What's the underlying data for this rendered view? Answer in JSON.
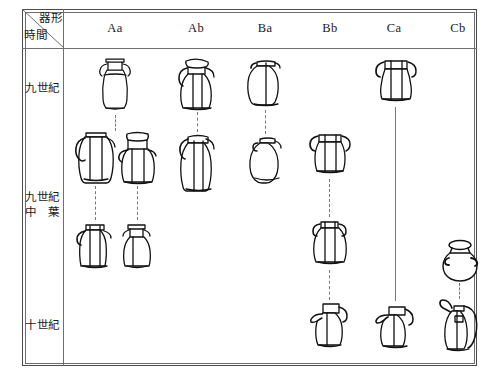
{
  "figure": {
    "kind": "ceramic-typology-chart",
    "corner": {
      "column_axis_label": "器形",
      "row_axis_label": "時間"
    },
    "columns": [
      {
        "key": "Aa",
        "label": "Aa",
        "x": 115
      },
      {
        "key": "Ab",
        "label": "Ab",
        "x": 196
      },
      {
        "key": "Ba",
        "label": "Ba",
        "x": 265
      },
      {
        "key": "Bb",
        "label": "Bb",
        "x": 330
      },
      {
        "key": "Ca",
        "label": "Ca",
        "x": 394
      },
      {
        "key": "Cb",
        "label": "Cb",
        "x": 458
      }
    ],
    "rows": [
      {
        "key": "r1",
        "label": "九世紀",
        "label_lines": [
          "九世紀"
        ],
        "y": 88
      },
      {
        "key": "r2",
        "label": "九世紀中葉",
        "label_lines": [
          "九世紀",
          "中　葉"
        ],
        "y": 198
      },
      {
        "key": "r3",
        "label": "十世紀",
        "label_lines": [
          "十世紀"
        ],
        "y": 325
      }
    ],
    "colors": {
      "ink": "#111111",
      "frame": "#4b4b4b",
      "rule": "#6f6f6f",
      "connector": "#777777",
      "background": "#ffffff"
    },
    "vessels": [
      {
        "id": "Aa-1",
        "column": "Aa",
        "row": "r1",
        "shape": "amphora-tall-handles",
        "x": 92,
        "y": 55,
        "w": 46,
        "h": 58
      },
      {
        "id": "Aa-2a",
        "column": "Aa",
        "row": "r2",
        "shape": "ovoid-wide-handles",
        "x": 74,
        "y": 130,
        "w": 42,
        "h": 54
      },
      {
        "id": "Aa-2b",
        "column": "Aa",
        "row": "r2",
        "shape": "jar-flared-rim-spout",
        "x": 117,
        "y": 130,
        "w": 40,
        "h": 54
      },
      {
        "id": "Aa-3a",
        "column": "Aa",
        "row": "r2",
        "shape": "squat-jar-handles",
        "x": 74,
        "y": 222,
        "w": 40,
        "h": 48
      },
      {
        "id": "Aa-3b",
        "column": "Aa",
        "row": "r2",
        "shape": "narrow-neck-jar",
        "x": 117,
        "y": 222,
        "w": 38,
        "h": 48
      },
      {
        "id": "Ab-1",
        "column": "Ab",
        "row": "r1",
        "shape": "ovoid-jar-pouring-rim",
        "x": 176,
        "y": 56,
        "w": 42,
        "h": 54
      },
      {
        "id": "Ab-2",
        "column": "Ab",
        "row": "r2",
        "shape": "tall-ovoid-handled-jar",
        "x": 176,
        "y": 133,
        "w": 42,
        "h": 58
      },
      {
        "id": "Ba-1",
        "column": "Ba",
        "row": "r1",
        "shape": "globular-jar-short-neck",
        "x": 244,
        "y": 58,
        "w": 42,
        "h": 50
      },
      {
        "id": "Ba-2",
        "column": "Ba",
        "row": "r2",
        "shape": "round-pot-small-rim",
        "x": 246,
        "y": 135,
        "w": 40,
        "h": 48
      },
      {
        "id": "Bb-2a",
        "column": "Bb",
        "row": "r2",
        "shape": "wide-mouth-jar",
        "x": 308,
        "y": 131,
        "w": 42,
        "h": 46
      },
      {
        "id": "Bb-2b",
        "column": "Bb",
        "row": "r2",
        "shape": "ovoid-jar-loop-handles",
        "x": 310,
        "y": 218,
        "w": 38,
        "h": 50
      },
      {
        "id": "Bb-3",
        "column": "Bb",
        "row": "r3",
        "shape": "spouted-ewer",
        "x": 308,
        "y": 300,
        "w": 42,
        "h": 50
      },
      {
        "id": "Ca-1",
        "column": "Ca",
        "row": "r1",
        "shape": "bucket-jar-handles",
        "x": 374,
        "y": 57,
        "w": 42,
        "h": 48
      },
      {
        "id": "Ca-3",
        "column": "Ca",
        "row": "r3",
        "shape": "spouted-ewer-squat",
        "x": 373,
        "y": 303,
        "w": 44,
        "h": 48
      },
      {
        "id": "Cb-2",
        "column": "Cb",
        "row": "r2",
        "shape": "round-jar-wide-rim",
        "x": 438,
        "y": 238,
        "w": 44,
        "h": 44
      },
      {
        "id": "Cb-3",
        "column": "Cb",
        "row": "r3",
        "shape": "long-spout-ewer",
        "x": 436,
        "y": 298,
        "w": 46,
        "h": 54
      }
    ],
    "connectors": [
      {
        "id": "conn-Aa-1-2",
        "from": "Aa-1",
        "to": "Aa-2",
        "style": "dashed",
        "x": 115,
        "y": 115,
        "length": 16
      },
      {
        "id": "conn-Aa-2a-3a",
        "from": "Aa-2a",
        "to": "Aa-3a",
        "style": "dashed",
        "x": 95,
        "y": 186,
        "length": 34
      },
      {
        "id": "conn-Aa-2b-3b",
        "from": "Aa-2b",
        "to": "Aa-3b",
        "style": "dashed",
        "x": 137,
        "y": 186,
        "length": 34
      },
      {
        "id": "conn-Ab-1-2",
        "from": "Ab-1",
        "to": "Ab-2",
        "style": "dashed",
        "x": 197,
        "y": 112,
        "length": 20
      },
      {
        "id": "conn-Ba-1-2",
        "from": "Ba-1",
        "to": "Ba-2",
        "style": "dashed",
        "x": 265,
        "y": 110,
        "length": 24
      },
      {
        "id": "conn-Bb-2a-2b",
        "from": "Bb-2a",
        "to": "Bb-2b",
        "style": "dashed",
        "x": 329,
        "y": 179,
        "length": 38
      },
      {
        "id": "conn-Bb-2b-3",
        "from": "Bb-2b",
        "to": "Bb-3",
        "style": "dashed",
        "x": 329,
        "y": 270,
        "length": 30
      },
      {
        "id": "conn-Ca-1-3",
        "from": "Ca-1",
        "to": "Ca-3",
        "style": "solid",
        "x": 395,
        "y": 107,
        "length": 194
      },
      {
        "id": "conn-Cb-2-3",
        "from": "Cb-2",
        "to": "Cb-3",
        "style": "dashed",
        "x": 459,
        "y": 283,
        "length": 16
      }
    ]
  }
}
